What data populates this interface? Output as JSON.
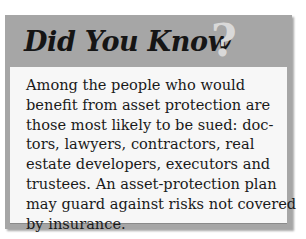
{
  "callout": {
    "title": "Did You Know",
    "title_mark": "?",
    "body_lines": [
      "Among the people who would",
      "benefit from asset protection are",
      "those most likely to be sued: doc-",
      "tors, lawyers, contractors, real",
      "estate developers, executors and",
      "trustees. An asset-protection plan",
      "may guard against risks not covered",
      "by insurance."
    ]
  },
  "colors": {
    "header_gray": "#a6a6a6",
    "panel_background": "#f7f7f7",
    "title_text": "#151515",
    "question_mark": "#d9d9d9"
  }
}
